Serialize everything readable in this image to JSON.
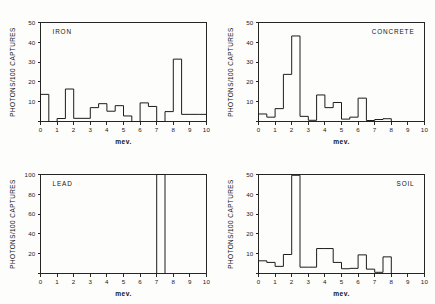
{
  "figure": {
    "background": "#fdfdfc",
    "line_color": "#1c1c1c",
    "axis_color": "#262626"
  },
  "chart_data": [
    {
      "type": "bar",
      "title": "IRON",
      "xlabel": "mev.",
      "ylabel": "PHOTONS/100 CAPTURES",
      "xlim": [
        0,
        10
      ],
      "ylim": [
        0,
        50
      ],
      "xticks": [
        0,
        1,
        2,
        3,
        4,
        5,
        6,
        7,
        8,
        9,
        10
      ],
      "yticks": [
        0,
        10,
        20,
        30,
        40,
        50
      ],
      "grid": false,
      "legend": "none",
      "bin_width": 0.5,
      "bin_edges": [
        0.0,
        0.5,
        1.0,
        1.5,
        2.0,
        2.5,
        3.0,
        3.5,
        4.0,
        4.5,
        5.0,
        5.5,
        6.0,
        6.5,
        7.0,
        7.5,
        8.0,
        8.5,
        9.0,
        9.5
      ],
      "values": [
        13.7,
        0.0,
        1.5,
        16.4,
        1.6,
        1.6,
        7.0,
        9.0,
        5.2,
        8.0,
        2.8,
        0.0,
        9.4,
        7.6,
        0.0,
        5.0,
        31.5,
        3.6,
        3.6,
        3.6
      ]
    },
    {
      "type": "bar",
      "title": "CONCRETE",
      "xlabel": "mev.",
      "ylabel": "PHOTONS/100 CAPTURES",
      "xlim": [
        0,
        10
      ],
      "ylim": [
        0,
        50
      ],
      "xticks": [
        0,
        1,
        2,
        3,
        4,
        5,
        6,
        7,
        8,
        9,
        10
      ],
      "yticks": [
        0,
        10,
        20,
        30,
        40,
        50
      ],
      "grid": false,
      "legend": "none",
      "bin_width": 0.5,
      "bin_edges": [
        0.0,
        0.5,
        1.0,
        1.5,
        2.0,
        2.5,
        3.0,
        3.5,
        4.0,
        4.5,
        5.0,
        5.5,
        6.0,
        6.5,
        7.0,
        7.5,
        8.0
      ],
      "values": [
        3.8,
        2.2,
        6.5,
        23.8,
        43.2,
        2.6,
        0.6,
        13.4,
        7.0,
        9.6,
        1.2,
        2.2,
        11.8,
        0.5,
        1.0,
        1.4,
        0.0
      ]
    },
    {
      "type": "bar",
      "title": "LEAD",
      "xlabel": "mev.",
      "ylabel": "PHOTONS/100 CAPTURES",
      "xlim": [
        0,
        10
      ],
      "ylim": [
        0,
        100
      ],
      "xticks": [
        0,
        1,
        2,
        3,
        4,
        5,
        6,
        7,
        8,
        9,
        10
      ],
      "yticks": [
        0,
        20,
        40,
        60,
        80,
        100
      ],
      "grid": false,
      "legend": "none",
      "bin_width": 0.5,
      "bin_edges": [
        7.0
      ],
      "values": [
        100.0
      ],
      "note_spike_range": [
        7.0,
        7.5
      ]
    },
    {
      "type": "bar",
      "title": "SOIL",
      "xlabel": "mev.",
      "ylabel": "PHOTONS/100 CAPTURES",
      "xlim": [
        0,
        10
      ],
      "ylim": [
        0,
        50
      ],
      "xticks": [
        0,
        1,
        2,
        3,
        4,
        5,
        6,
        7,
        8,
        9,
        10
      ],
      "yticks": [
        0,
        10,
        20,
        30,
        40,
        50
      ],
      "grid": false,
      "legend": "none",
      "bin_width": 0.5,
      "bin_edges": [
        0.0,
        0.5,
        1.0,
        1.5,
        2.0,
        2.5,
        3.0,
        3.5,
        4.0,
        4.5,
        5.0,
        5.5,
        6.0,
        6.5,
        7.0,
        7.5,
        8.0
      ],
      "values": [
        6.4,
        5.6,
        3.6,
        9.6,
        49.6,
        3.2,
        3.2,
        12.6,
        12.6,
        5.6,
        2.4,
        2.6,
        9.4,
        2.2,
        0.6,
        8.4,
        0.0
      ]
    }
  ],
  "panels": {
    "iron": {
      "label": "IRON"
    },
    "concrete": {
      "label": "CONCRETE"
    },
    "lead": {
      "label": "LEAD"
    },
    "soil": {
      "label": "SOIL"
    }
  }
}
